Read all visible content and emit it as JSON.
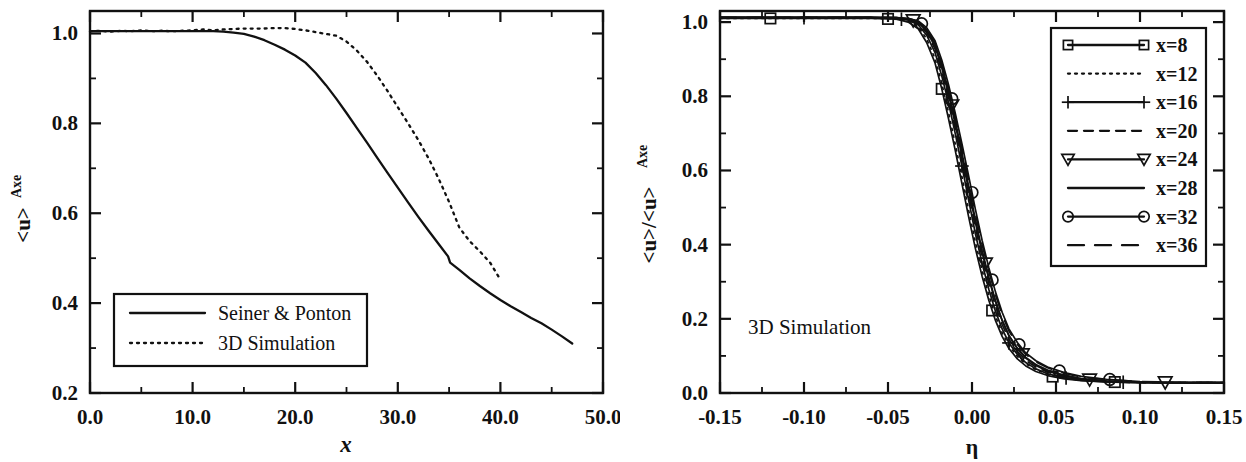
{
  "figure": {
    "background": "#ffffff",
    "ink_color": "#111111",
    "panel_count": 2
  },
  "chart_data": [
    {
      "panel": "left",
      "type": "line",
      "title": "",
      "xlabel": "x",
      "ylabel": "<u>_Axe",
      "ylabel_main": "<u>",
      "ylabel_sub": "Axe",
      "xlim": [
        0.0,
        50.0
      ],
      "ylim": [
        0.2,
        1.05
      ],
      "xticks": [
        "0.0",
        "10.0",
        "20.0",
        "30.0",
        "40.0",
        "50.0"
      ],
      "xtick_values": [
        0.0,
        10.0,
        20.0,
        30.0,
        40.0,
        50.0
      ],
      "xtick_minor_step": 5.0,
      "yticks": [
        "0.2",
        "0.4",
        "0.6",
        "0.8",
        "1.0"
      ],
      "ytick_values": [
        0.2,
        0.4,
        0.6,
        0.8,
        1.0
      ],
      "ytick_minor_step": 0.1,
      "grid": false,
      "legend_position": "lower-left",
      "series": [
        {
          "name": "Seiner & Ponton",
          "style": "solid",
          "marker": "none",
          "x": [
            0.0,
            1.0,
            2.0,
            3.0,
            4.0,
            5.0,
            6.0,
            7.0,
            8.0,
            9.0,
            10.0,
            11.0,
            12.0,
            13.0,
            14.0,
            15.0,
            16.0,
            17.0,
            18.0,
            19.0,
            20.0,
            21.0,
            22.0,
            23.0,
            24.0,
            25.0,
            26.0,
            27.0,
            28.0,
            29.0,
            30.0,
            31.0,
            32.0,
            33.0,
            34.0,
            34.9,
            35.1,
            36.0,
            37.0,
            38.0,
            39.0,
            40.0,
            41.0,
            42.0,
            43.0,
            44.0,
            45.0,
            46.0,
            47.0
          ],
          "y": [
            1.005,
            1.005,
            1.005,
            1.005,
            1.005,
            1.005,
            1.005,
            1.005,
            1.005,
            1.005,
            1.005,
            1.005,
            1.005,
            1.004,
            1.002,
            0.999,
            0.993,
            0.985,
            0.975,
            0.964,
            0.951,
            0.935,
            0.912,
            0.885,
            0.855,
            0.823,
            0.79,
            0.757,
            0.723,
            0.69,
            0.657,
            0.624,
            0.592,
            0.561,
            0.531,
            0.504,
            0.49,
            0.474,
            0.455,
            0.438,
            0.422,
            0.407,
            0.393,
            0.38,
            0.367,
            0.355,
            0.341,
            0.326,
            0.31
          ]
        },
        {
          "name": "3D Simulation",
          "style": "dotted",
          "marker": "none",
          "x": [
            0.0,
            1.0,
            2.0,
            3.0,
            4.0,
            5.0,
            6.0,
            7.0,
            8.0,
            9.0,
            10.0,
            11.0,
            12.0,
            13.0,
            14.0,
            15.0,
            16.0,
            17.0,
            18.0,
            19.0,
            20.0,
            21.0,
            22.0,
            23.0,
            24.0,
            25.0,
            26.0,
            27.0,
            28.0,
            29.0,
            30.0,
            31.0,
            32.0,
            33.0,
            34.0,
            35.0,
            36.0,
            37.0,
            38.0,
            39.0,
            40.0
          ],
          "y": [
            1.005,
            1.006,
            1.004,
            1.006,
            1.005,
            1.007,
            1.005,
            1.006,
            1.005,
            1.006,
            1.007,
            1.009,
            1.007,
            1.009,
            1.01,
            1.011,
            1.011,
            1.011,
            1.012,
            1.012,
            1.01,
            1.007,
            1.003,
            0.999,
            0.995,
            0.982,
            0.962,
            0.937,
            0.906,
            0.872,
            0.836,
            0.8,
            0.763,
            0.722,
            0.676,
            0.625,
            0.568,
            0.538,
            0.515,
            0.49,
            0.452
          ]
        }
      ],
      "legend": {
        "entries": [
          {
            "label": "Seiner & Ponton",
            "style": "solid"
          },
          {
            "label": "3D Simulation",
            "style": "dotted"
          }
        ]
      }
    },
    {
      "panel": "right",
      "type": "line",
      "title": "",
      "xlabel": "η",
      "ylabel": "<u>/<u>_Axe",
      "ylabel_main": "<u>/<u>",
      "ylabel_sub": "Axe",
      "xlim": [
        -0.15,
        0.15
      ],
      "ylim": [
        0.0,
        1.03
      ],
      "xticks": [
        "-0.15",
        "-0.10",
        "-0.05",
        "0.00",
        "0.05",
        "0.10",
        "0.15"
      ],
      "xtick_values": [
        -0.15,
        -0.1,
        -0.05,
        0.0,
        0.05,
        0.1,
        0.15
      ],
      "xtick_minor_step": 0.025,
      "yticks": [
        "0.0",
        "0.2",
        "0.4",
        "0.6",
        "0.8",
        "1.0"
      ],
      "ytick_values": [
        0.0,
        0.2,
        0.4,
        0.6,
        0.8,
        1.0
      ],
      "ytick_minor_step": 0.1,
      "grid": false,
      "legend_position": "upper-right",
      "annotation": "3D Simulation",
      "series": [
        {
          "name": "x=8",
          "style": "solid",
          "marker": "square",
          "marker_x": [
            -0.12,
            -0.05,
            -0.018,
            0.012,
            0.048,
            0.085
          ],
          "x": [
            -0.15,
            -0.12,
            -0.09,
            -0.06,
            -0.045,
            -0.038,
            -0.032,
            -0.027,
            -0.022,
            -0.018,
            -0.014,
            -0.01,
            -0.006,
            -0.002,
            0.002,
            0.006,
            0.01,
            0.014,
            0.018,
            0.022,
            0.027,
            0.032,
            0.038,
            0.045,
            0.055,
            0.065,
            0.08,
            0.1,
            0.12,
            0.15
          ],
          "y": [
            1.01,
            1.01,
            1.01,
            1.01,
            1.008,
            1.0,
            0.982,
            0.945,
            0.89,
            0.82,
            0.74,
            0.655,
            0.565,
            0.475,
            0.39,
            0.315,
            0.25,
            0.195,
            0.152,
            0.12,
            0.092,
            0.073,
            0.058,
            0.047,
            0.038,
            0.033,
            0.03,
            0.028,
            0.027,
            0.027
          ]
        },
        {
          "name": "x=12",
          "style": "dotted",
          "marker": "none",
          "marker_x": [],
          "x": [
            -0.15,
            -0.12,
            -0.09,
            -0.06,
            -0.045,
            -0.038,
            -0.032,
            -0.027,
            -0.022,
            -0.018,
            -0.014,
            -0.01,
            -0.006,
            -0.002,
            0.002,
            0.006,
            0.01,
            0.014,
            0.018,
            0.022,
            0.027,
            0.032,
            0.038,
            0.045,
            0.055,
            0.065,
            0.08,
            0.1,
            0.12,
            0.15
          ],
          "y": [
            1.01,
            1.01,
            1.01,
            1.01,
            1.009,
            1.003,
            0.988,
            0.955,
            0.902,
            0.835,
            0.757,
            0.672,
            0.583,
            0.493,
            0.407,
            0.331,
            0.264,
            0.207,
            0.162,
            0.128,
            0.099,
            0.079,
            0.063,
            0.051,
            0.041,
            0.035,
            0.031,
            0.029,
            0.028,
            0.028
          ]
        },
        {
          "name": "x=16",
          "style": "solid",
          "marker": "plus",
          "marker_x": [
            -0.1,
            -0.042,
            -0.006,
            0.022,
            0.056,
            0.09
          ],
          "x": [
            -0.15,
            -0.12,
            -0.09,
            -0.06,
            -0.045,
            -0.038,
            -0.032,
            -0.027,
            -0.022,
            -0.018,
            -0.014,
            -0.01,
            -0.006,
            -0.002,
            0.002,
            0.006,
            0.01,
            0.014,
            0.018,
            0.022,
            0.027,
            0.032,
            0.038,
            0.045,
            0.055,
            0.065,
            0.08,
            0.1,
            0.12,
            0.15
          ],
          "y": [
            1.012,
            1.012,
            1.012,
            1.012,
            1.01,
            1.005,
            0.993,
            0.965,
            0.918,
            0.855,
            0.783,
            0.7,
            0.612,
            0.52,
            0.43,
            0.35,
            0.28,
            0.22,
            0.172,
            0.135,
            0.104,
            0.082,
            0.065,
            0.052,
            0.041,
            0.034,
            0.03,
            0.028,
            0.027,
            0.027
          ]
        },
        {
          "name": "x=20",
          "style": "dashed",
          "marker": "none",
          "marker_x": [],
          "x": [
            -0.15,
            -0.12,
            -0.09,
            -0.06,
            -0.045,
            -0.038,
            -0.032,
            -0.027,
            -0.022,
            -0.018,
            -0.014,
            -0.01,
            -0.006,
            -0.002,
            0.002,
            0.006,
            0.01,
            0.014,
            0.018,
            0.022,
            0.027,
            0.032,
            0.038,
            0.045,
            0.055,
            0.065,
            0.08,
            0.1,
            0.12,
            0.15
          ],
          "y": [
            1.012,
            1.012,
            1.012,
            1.012,
            1.011,
            1.007,
            0.996,
            0.972,
            0.928,
            0.868,
            0.796,
            0.714,
            0.626,
            0.535,
            0.447,
            0.366,
            0.296,
            0.234,
            0.184,
            0.145,
            0.112,
            0.088,
            0.07,
            0.056,
            0.044,
            0.036,
            0.031,
            0.028,
            0.027,
            0.027
          ]
        },
        {
          "name": "x=24",
          "style": "solid",
          "marker": "triangle-down",
          "marker_x": [
            -0.035,
            -0.012,
            0.008,
            0.03,
            0.07,
            0.115
          ],
          "x": [
            -0.15,
            -0.12,
            -0.09,
            -0.06,
            -0.045,
            -0.038,
            -0.032,
            -0.027,
            -0.022,
            -0.018,
            -0.014,
            -0.01,
            -0.006,
            -0.002,
            0.002,
            0.006,
            0.01,
            0.014,
            0.018,
            0.022,
            0.027,
            0.032,
            0.038,
            0.045,
            0.055,
            0.065,
            0.08,
            0.1,
            0.12,
            0.15
          ],
          "y": [
            1.013,
            1.013,
            1.013,
            1.013,
            1.012,
            1.009,
            1.0,
            0.979,
            0.94,
            0.885,
            0.815,
            0.735,
            0.648,
            0.558,
            0.468,
            0.385,
            0.312,
            0.248,
            0.195,
            0.154,
            0.119,
            0.094,
            0.074,
            0.059,
            0.046,
            0.038,
            0.032,
            0.029,
            0.028,
            0.028
          ]
        },
        {
          "name": "x=28",
          "style": "solid",
          "marker": "none",
          "marker_x": [],
          "x": [
            -0.15,
            -0.12,
            -0.09,
            -0.06,
            -0.045,
            -0.038,
            -0.032,
            -0.027,
            -0.022,
            -0.018,
            -0.014,
            -0.01,
            -0.006,
            -0.002,
            0.002,
            0.006,
            0.01,
            0.014,
            0.018,
            0.022,
            0.027,
            0.032,
            0.038,
            0.045,
            0.055,
            0.065,
            0.08,
            0.1,
            0.12,
            0.15
          ],
          "y": [
            1.012,
            1.012,
            1.012,
            1.012,
            1.011,
            1.008,
            0.999,
            0.976,
            0.934,
            0.877,
            0.806,
            0.725,
            0.638,
            0.548,
            0.46,
            0.379,
            0.308,
            0.246,
            0.195,
            0.155,
            0.121,
            0.096,
            0.077,
            0.062,
            0.048,
            0.039,
            0.033,
            0.029,
            0.028,
            0.028
          ]
        },
        {
          "name": "x=32",
          "style": "solid",
          "marker": "circle",
          "marker_x": [
            -0.03,
            -0.012,
            0.0,
            0.012,
            0.028,
            0.052,
            0.082
          ],
          "x": [
            -0.15,
            -0.12,
            -0.09,
            -0.06,
            -0.045,
            -0.038,
            -0.032,
            -0.027,
            -0.022,
            -0.018,
            -0.014,
            -0.01,
            -0.006,
            -0.002,
            0.002,
            0.006,
            0.01,
            0.014,
            0.018,
            0.022,
            0.027,
            0.032,
            0.038,
            0.045,
            0.055,
            0.065,
            0.08,
            0.1,
            0.12,
            0.15
          ],
          "y": [
            1.013,
            1.013,
            1.013,
            1.013,
            1.012,
            1.01,
            1.003,
            0.985,
            0.95,
            0.898,
            0.832,
            0.755,
            0.672,
            0.585,
            0.496,
            0.412,
            0.338,
            0.272,
            0.217,
            0.173,
            0.136,
            0.108,
            0.087,
            0.07,
            0.055,
            0.045,
            0.037,
            0.031,
            0.029,
            0.029
          ]
        },
        {
          "name": "x=36",
          "style": "longdash",
          "marker": "none",
          "marker_x": [],
          "x": [
            -0.15,
            -0.12,
            -0.09,
            -0.06,
            -0.045,
            -0.038,
            -0.032,
            -0.027,
            -0.022,
            -0.018,
            -0.014,
            -0.01,
            -0.006,
            -0.002,
            0.002,
            0.006,
            0.01,
            0.014,
            0.018,
            0.022,
            0.027,
            0.032,
            0.038,
            0.045,
            0.055,
            0.065,
            0.08,
            0.1,
            0.12,
            0.15
          ],
          "y": [
            1.013,
            1.013,
            1.013,
            1.013,
            1.012,
            1.01,
            1.002,
            0.982,
            0.945,
            0.891,
            0.823,
            0.745,
            0.66,
            0.572,
            0.484,
            0.401,
            0.328,
            0.264,
            0.21,
            0.167,
            0.131,
            0.104,
            0.084,
            0.068,
            0.053,
            0.043,
            0.036,
            0.031,
            0.029,
            0.029
          ]
        }
      ],
      "legend": {
        "entries": [
          {
            "label": "x=8",
            "style": "solid",
            "marker": "square"
          },
          {
            "label": "x=12",
            "style": "dotted",
            "marker": "none"
          },
          {
            "label": "x=16",
            "style": "solid",
            "marker": "plus"
          },
          {
            "label": "x=20",
            "style": "dashed",
            "marker": "none"
          },
          {
            "label": "x=24",
            "style": "solid",
            "marker": "triangle-down"
          },
          {
            "label": "x=28",
            "style": "solid",
            "marker": "none"
          },
          {
            "label": "x=32",
            "style": "solid",
            "marker": "circle"
          },
          {
            "label": "x=36",
            "style": "longdash",
            "marker": "none"
          }
        ]
      }
    }
  ]
}
